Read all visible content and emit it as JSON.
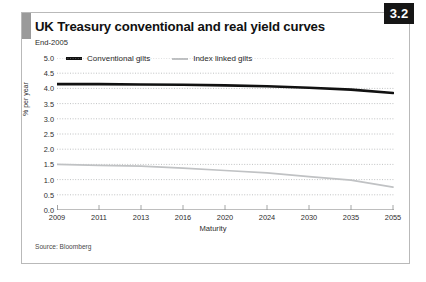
{
  "figure": {
    "badge": "3.2",
    "title": "UK Treasury conventional and real yield curves",
    "subtitle": "End-2005",
    "source": "Source: Bloomberg"
  },
  "legend": {
    "items": [
      {
        "label": "Conventional gilts",
        "color": "#111111",
        "style": "thick-solid"
      },
      {
        "label": "Index linked gilts",
        "color": "#c0c2c4",
        "style": "thin-solid"
      }
    ]
  },
  "chart_data": {
    "type": "line",
    "title": "UK Treasury conventional and real yield curves",
    "subtitle": "End-2005",
    "xlabel": "Maturity",
    "ylabel": "% per year",
    "ylim": [
      0.0,
      5.0
    ],
    "ytick_labels": [
      "0.0",
      "0.5",
      "1.0",
      "1.5",
      "2.0",
      "2.5",
      "3.0",
      "3.5",
      "4.0",
      "4.5",
      "5.0"
    ],
    "yticks": [
      0.0,
      0.5,
      1.0,
      1.5,
      2.0,
      2.5,
      3.0,
      3.5,
      4.0,
      4.5,
      5.0
    ],
    "categories": [
      "2009",
      "2011",
      "2013",
      "2016",
      "2020",
      "2024",
      "2030",
      "2035",
      "2055"
    ],
    "grid": "horizontal-dotted",
    "legend_position": "top-left",
    "series": [
      {
        "name": "Conventional gilts",
        "color": "#111111",
        "values": [
          4.14,
          4.14,
          4.13,
          4.12,
          4.1,
          4.07,
          4.02,
          3.96,
          3.85
        ]
      },
      {
        "name": "Index linked gilts",
        "color": "#c0c2c4",
        "values": [
          1.5,
          1.47,
          1.44,
          1.38,
          1.3,
          1.22,
          1.1,
          0.98,
          0.75
        ]
      }
    ]
  }
}
